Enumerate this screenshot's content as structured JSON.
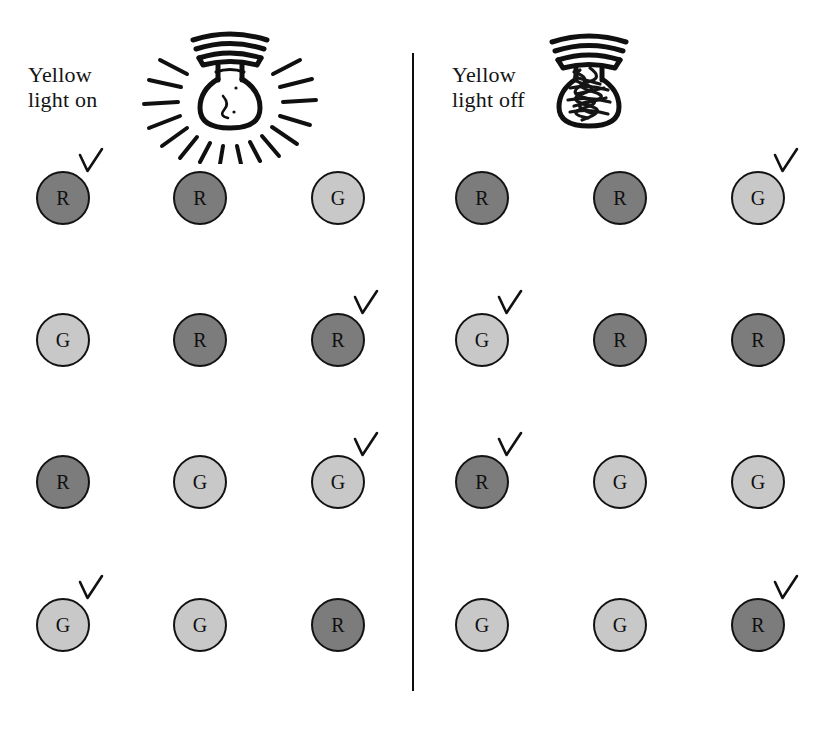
{
  "figure": {
    "background_color": "#ffffff",
    "divider_color": "#0d0d0d"
  },
  "legend": {
    "token_red_label": "R",
    "token_green_label": "G",
    "token_red_color": "#7c7c7c",
    "token_green_color": "#c8c8c8",
    "token_outline_color": "#121212",
    "check_mark_color": "#111111"
  },
  "panels": [
    {
      "id": "on",
      "label": "Yellow\nlight on",
      "label_line1": "Yellow",
      "label_line2": "light on",
      "bulb_icon": "light-bulb-lit-icon",
      "bulb_state": "on",
      "rows": [
        {
          "tokens": [
            {
              "label": "R",
              "type": "R",
              "checked": true
            },
            {
              "label": "R",
              "type": "R",
              "checked": false
            },
            {
              "label": "G",
              "type": "G",
              "checked": false
            }
          ]
        },
        {
          "tokens": [
            {
              "label": "G",
              "type": "G",
              "checked": false
            },
            {
              "label": "R",
              "type": "R",
              "checked": false
            },
            {
              "label": "R",
              "type": "R",
              "checked": true
            }
          ]
        },
        {
          "tokens": [
            {
              "label": "R",
              "type": "R",
              "checked": false
            },
            {
              "label": "G",
              "type": "G",
              "checked": false
            },
            {
              "label": "G",
              "type": "G",
              "checked": true
            }
          ]
        },
        {
          "tokens": [
            {
              "label": "G",
              "type": "G",
              "checked": true
            },
            {
              "label": "G",
              "type": "G",
              "checked": false
            },
            {
              "label": "R",
              "type": "R",
              "checked": false
            }
          ]
        }
      ]
    },
    {
      "id": "off",
      "label": "Yellow\nlight off",
      "label_line1": "Yellow",
      "label_line2": "light off",
      "bulb_icon": "light-bulb-unlit-icon",
      "bulb_state": "off",
      "rows": [
        {
          "tokens": [
            {
              "label": "R",
              "type": "R",
              "checked": false
            },
            {
              "label": "R",
              "type": "R",
              "checked": false
            },
            {
              "label": "G",
              "type": "G",
              "checked": true
            }
          ]
        },
        {
          "tokens": [
            {
              "label": "G",
              "type": "G",
              "checked": true
            },
            {
              "label": "R",
              "type": "R",
              "checked": false
            },
            {
              "label": "R",
              "type": "R",
              "checked": false
            }
          ]
        },
        {
          "tokens": [
            {
              "label": "R",
              "type": "R",
              "checked": true
            },
            {
              "label": "G",
              "type": "G",
              "checked": false
            },
            {
              "label": "G",
              "type": "G",
              "checked": false
            }
          ]
        },
        {
          "tokens": [
            {
              "label": "G",
              "type": "G",
              "checked": false
            },
            {
              "label": "G",
              "type": "G",
              "checked": false
            },
            {
              "label": "R",
              "type": "R",
              "checked": true
            }
          ]
        }
      ]
    }
  ],
  "layout": {
    "column_x_on": [
      36,
      173,
      311
    ],
    "column_x_off": [
      455,
      593,
      731
    ],
    "row_y": [
      171,
      313,
      455,
      598
    ]
  }
}
